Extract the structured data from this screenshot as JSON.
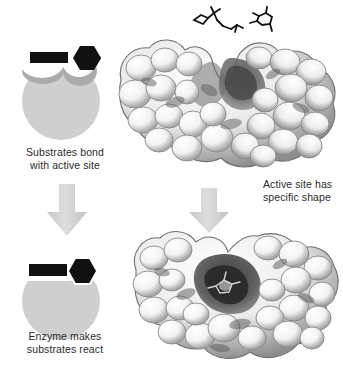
{
  "figure": {
    "background_color": "#ffffff"
  },
  "colors": {
    "enzyme_fill": "#cfcfcf",
    "enzyme_shadow": "#ababab",
    "substrate_fill": "#111111",
    "notch_fill": "#ffffff",
    "arrow_fill": "#d4d4d4",
    "caption_text": "#2b2b2b",
    "protein_light": "#fbfbfb",
    "protein_mid": "#9a9a9a",
    "protein_dark": "#3a3a3a"
  },
  "captions": {
    "step1": {
      "line1": "Substrates bond",
      "line2": "with active site"
    },
    "step2": {
      "line1": "Enzyme makes",
      "line2": "substrates react"
    },
    "active_site": {
      "line1": "Active site has",
      "line2": "specific shape"
    }
  },
  "schematic_top": {
    "name": "unbound-enzyme-schematic",
    "enzyme_label": "enzyme",
    "substrate_bar_label": "rectangular-substrate",
    "substrate_hex_label": "hexagonal-substrate",
    "state": "unbound"
  },
  "schematic_bottom": {
    "name": "bound-enzyme-schematic",
    "enzyme_label": "enzyme",
    "substrate_bar_label": "rectangular-substrate",
    "substrate_hex_label": "hexagonal-substrate",
    "state": "bound"
  },
  "proteins": {
    "top": {
      "name": "protein-surface-open",
      "description": "Molecular surface model with open active site cleft"
    },
    "bottom": {
      "name": "protein-surface-closed",
      "description": "Molecular surface model with substrate bound in cleft"
    }
  },
  "molecules": {
    "substrate_a": "stick-model-substrate-a",
    "substrate_b": "stick-model-substrate-b"
  },
  "arrows": {
    "left": "down-arrow",
    "right": "down-arrow"
  }
}
